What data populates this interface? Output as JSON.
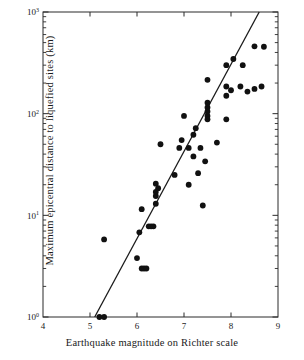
{
  "chart_data": {
    "type": "scatter",
    "title": "",
    "xlabel": "Earthquake magnitude on Richter scale",
    "ylabel": "Maximum epicentral distance to liquefied sites (km)",
    "xlim": [
      4,
      9
    ],
    "ylim": [
      1,
      1000
    ],
    "yscale": "log",
    "xscale": "linear",
    "grid": false,
    "legend": null,
    "xticks": [
      "4",
      "5",
      "6",
      "7",
      "8",
      "9"
    ],
    "xtick_values": [
      4,
      5,
      6,
      7,
      8,
      9
    ],
    "ytick_labels": [
      "10^0",
      "10^1",
      "10^2",
      "10^3"
    ],
    "ytick_bases": [
      "10",
      "10",
      "10",
      "10"
    ],
    "ytick_exponents": [
      "0",
      "1",
      "2",
      "3"
    ],
    "ytick_values": [
      1,
      10,
      100,
      1000
    ],
    "series": [
      {
        "name": "Liquefaction sites",
        "marker": "filled-circle",
        "color": "#111111",
        "points": [
          [
            5.2,
            1.0
          ],
          [
            5.3,
            1.0
          ],
          [
            5.3,
            5.8
          ],
          [
            6.0,
            3.8
          ],
          [
            6.1,
            3.0
          ],
          [
            6.15,
            3.0
          ],
          [
            6.2,
            3.0
          ],
          [
            6.05,
            6.8
          ],
          [
            6.1,
            11.5
          ],
          [
            6.25,
            7.8
          ],
          [
            6.3,
            7.8
          ],
          [
            6.35,
            7.8
          ],
          [
            6.4,
            13.0
          ],
          [
            6.4,
            15.5
          ],
          [
            6.4,
            17.0
          ],
          [
            6.4,
            20.5
          ],
          [
            6.45,
            18.5
          ],
          [
            6.5,
            50.0
          ],
          [
            6.8,
            25.0
          ],
          [
            6.9,
            46.0
          ],
          [
            6.95,
            55.0
          ],
          [
            7.0,
            95.0
          ],
          [
            7.1,
            46.0
          ],
          [
            7.1,
            20.0
          ],
          [
            7.2,
            38.0
          ],
          [
            7.2,
            62.0
          ],
          [
            7.25,
            72.0
          ],
          [
            7.3,
            26.0
          ],
          [
            7.35,
            46.0
          ],
          [
            7.4,
            12.5
          ],
          [
            7.45,
            34.0
          ],
          [
            7.5,
            95.0
          ],
          [
            7.5,
            105.0
          ],
          [
            7.5,
            115.0
          ],
          [
            7.5,
            128.0
          ],
          [
            7.5,
            215.0
          ],
          [
            7.5,
            88.0
          ],
          [
            7.7,
            52.0
          ],
          [
            7.9,
            88.0
          ],
          [
            7.9,
            150.0
          ],
          [
            7.9,
            185.0
          ],
          [
            7.9,
            300.0
          ],
          [
            8.0,
            170.0
          ],
          [
            8.05,
            345.0
          ],
          [
            8.2,
            185.0
          ],
          [
            8.25,
            300.0
          ],
          [
            8.35,
            165.0
          ],
          [
            8.5,
            175.0
          ],
          [
            8.5,
            460.0
          ],
          [
            8.65,
            185.0
          ],
          [
            8.7,
            455.0
          ]
        ]
      }
    ],
    "trendline": {
      "name": "upper-bound regression line",
      "x_start": 5.1,
      "y_start": 1.0,
      "x_end": 8.6,
      "y_end": 1000.0
    }
  },
  "figure": {
    "background": "#ffffff",
    "ink_color": "#111111"
  }
}
